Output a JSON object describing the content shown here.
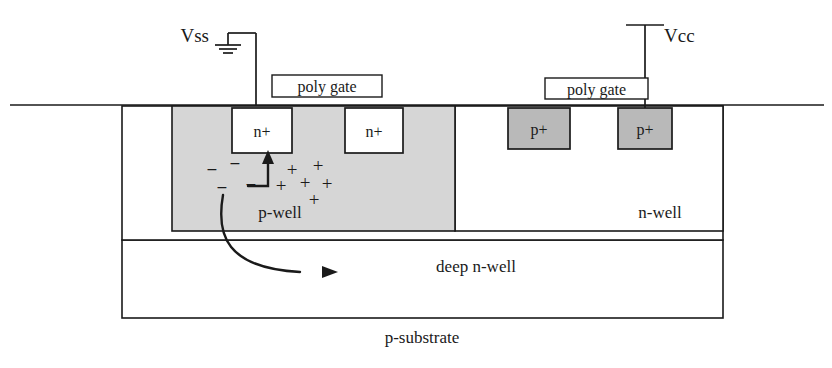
{
  "figure": {
    "type": "semiconductor-cross-section",
    "title_visible": false
  },
  "colors": {
    "background": "#ffffff",
    "outline": "#1a1a1a",
    "p_well_fill": "#d6d6d6",
    "p_plus_fill": "#b9b9b9",
    "n_plus_fill": "#ffffff",
    "n_well_fill": "#ffffff",
    "deep_n_well_fill": "#ffffff",
    "p_substrate_fill": "#ffffff",
    "text": "#1a1a1a"
  },
  "terminals": [
    {
      "id": "vss",
      "label": "Vss",
      "symbol": "ground-symbol",
      "label_x": 209,
      "label_y": 34,
      "wire_top_y": 33,
      "wire_x": 256,
      "wire_bottom_y": 106,
      "bar_x": 228,
      "connects_to": "n-plus-left"
    },
    {
      "id": "vcc",
      "label": "Vcc",
      "symbol": "terminal-bar",
      "label_x": 664,
      "label_y": 34,
      "wire_top_y": 25,
      "wire_x": 645,
      "wire_bottom_y": 108,
      "bar_half_width": 19,
      "connects_to": "p-plus-right"
    }
  ],
  "gates": [
    {
      "id": "poly-gate-left",
      "label": "poly gate",
      "x": 272,
      "y": 75,
      "width": 110,
      "height": 22
    },
    {
      "id": "poly-gate-right",
      "label": "poly gate",
      "x": 545,
      "y": 78,
      "width": 103,
      "height": 21
    }
  ],
  "surface": {
    "id": "wafer-surface-line",
    "x1": 10,
    "x2": 824,
    "y": 105
  },
  "regions": [
    {
      "id": "p-substrate",
      "label": "p-substrate",
      "x": 122,
      "y": 240,
      "width": 601,
      "height": 78,
      "fill": "#ffffff",
      "label_x": 422,
      "label_y": 343
    },
    {
      "id": "deep-n-well",
      "label": "deep n-well",
      "x": 122,
      "y": 106,
      "width": 601,
      "height": 134,
      "fill": "#ffffff",
      "label_x": 476,
      "label_y": 272
    },
    {
      "id": "n-well",
      "label": "n-well",
      "x": 455,
      "y": 106,
      "width": 268,
      "height": 125,
      "fill": "#ffffff",
      "label_x": 660,
      "label_y": 218
    },
    {
      "id": "p-well",
      "label": "p-well",
      "x": 172,
      "y": 106,
      "width": 283,
      "height": 125,
      "fill": "#d6d6d6",
      "label_x": 280,
      "label_y": 218
    }
  ],
  "diffusions": [
    {
      "id": "n-plus-left",
      "label": "n+",
      "type": "n+",
      "x": 232,
      "y": 108,
      "width": 60,
      "height": 45,
      "fill": "#ffffff"
    },
    {
      "id": "n-plus-right",
      "label": "n+",
      "type": "n+",
      "x": 345,
      "y": 108,
      "width": 58,
      "height": 45,
      "fill": "#ffffff"
    },
    {
      "id": "p-plus-left",
      "label": "p+",
      "type": "p+",
      "x": 508,
      "y": 108,
      "width": 62,
      "height": 41,
      "fill": "#b9b9b9"
    },
    {
      "id": "p-plus-right",
      "label": "p+",
      "type": "p+",
      "x": 618,
      "y": 108,
      "width": 54,
      "height": 41,
      "fill": "#b9b9b9"
    }
  ],
  "charges": {
    "electrons": {
      "symbol": "−",
      "count": 4,
      "positions": [
        {
          "x": 212,
          "y": 176
        },
        {
          "x": 235,
          "y": 170
        },
        {
          "x": 222,
          "y": 194
        },
        {
          "x": 251,
          "y": 191
        }
      ]
    },
    "holes": {
      "symbol": "+",
      "count": 6,
      "positions": [
        {
          "x": 292,
          "y": 176
        },
        {
          "x": 318,
          "y": 172
        },
        {
          "x": 281,
          "y": 192
        },
        {
          "x": 305,
          "y": 189
        },
        {
          "x": 327,
          "y": 190
        },
        {
          "x": 314,
          "y": 206
        }
      ]
    }
  },
  "arrows": [
    {
      "id": "electron-injection-arrow",
      "description": "bent arrow from p-well up into left n+ region",
      "path": "M 248 186 L 268 186 L 268 165 L 268 156",
      "head_at": {
        "x": 268,
        "y": 152
      },
      "direction": "up"
    },
    {
      "id": "carrier-flow-arrow",
      "description": "curved arrow from p-well down into deep n-well, pointing right",
      "path": "M 223 195 C 216 235, 226 268, 300 272",
      "head_at": {
        "x": 336,
        "y": 272
      },
      "direction": "right"
    }
  ]
}
